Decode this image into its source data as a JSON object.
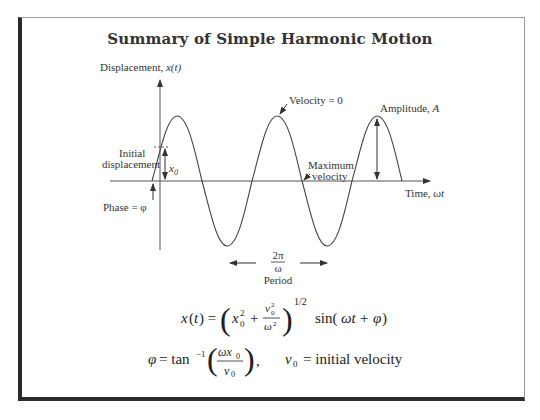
{
  "title": "Summary of Simple Harmonic Motion",
  "diagram": {
    "y_axis_label": "Displacement, x(t)",
    "x_axis_label": "Time, ωt",
    "labels": {
      "velocity_zero": "Velocity = 0",
      "amplitude": "Amplitude, A",
      "initial_line1": "Initial",
      "initial_line2": "displacement",
      "x0": "x0",
      "maximum_line1": "Maximum",
      "maximum_line2": "velocity",
      "phase": "Phase = φ",
      "period_num": "2π",
      "period_den": "ω",
      "period_label": "Period"
    },
    "colors": {
      "line": "#444444",
      "frame_heavy": "#2a2a2a",
      "frame_light": "#9a9a9a"
    }
  },
  "equations": {
    "displacement": "x(t) = (x0² + v0²/ω²)^(1/2) sin(ωt + φ)",
    "phase": "φ = tan⁻¹(ωx0 / v0)",
    "v0_def": "v0 = initial velocity"
  }
}
